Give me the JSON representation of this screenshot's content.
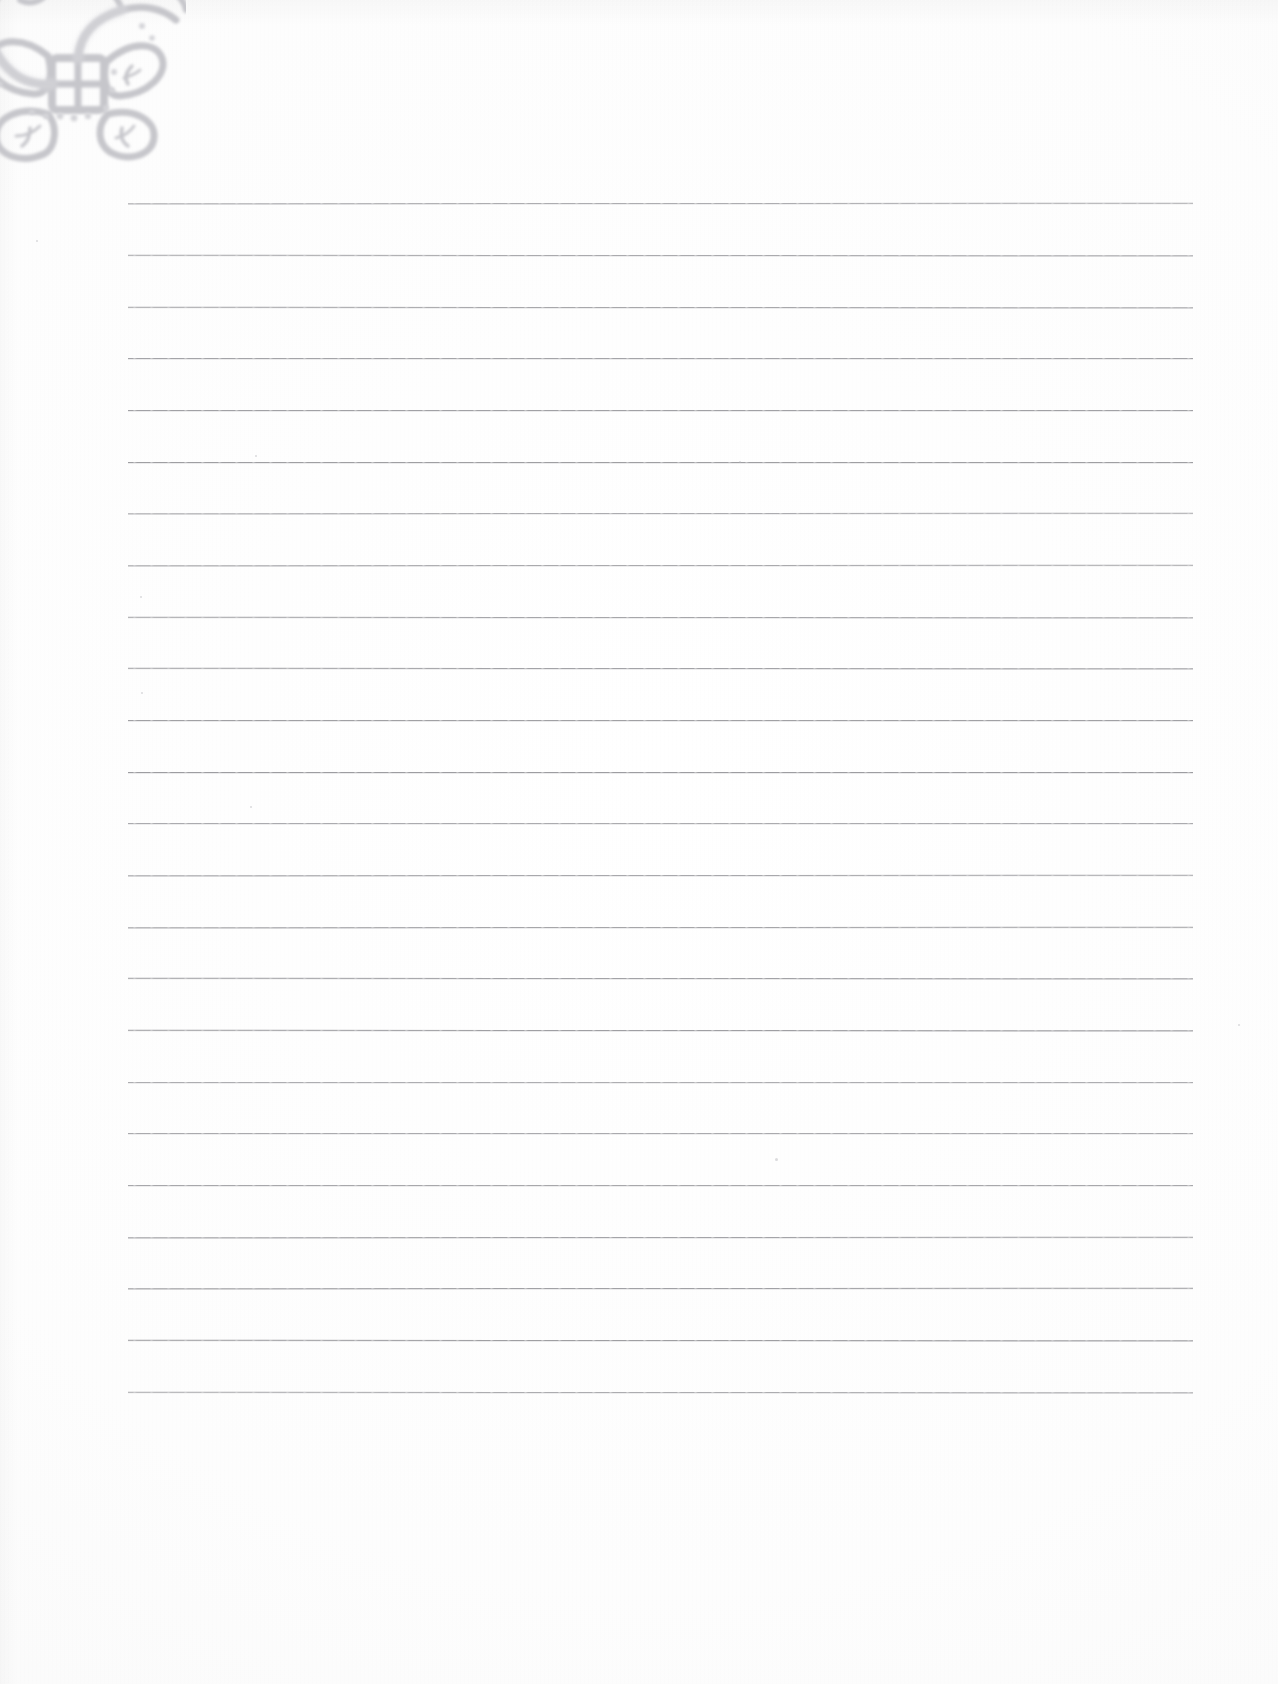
{
  "document": {
    "kind": "scanned-page",
    "title": "Blank ruled notepad page",
    "page_width": 1278,
    "page_height": 1684,
    "background_color": "#fdfdfd",
    "has_text": false,
    "text_content": ""
  },
  "ornament": {
    "name": "lace-corner-ornament",
    "description": "Faint grey lace / embossed floral corner motif with four leaf shapes around a square lattice center",
    "color": "#c9c9cd",
    "accent_color": "#bdbdc2",
    "position": "top-left",
    "bounds": {
      "x": -44,
      "y": -34,
      "width": 230,
      "height": 205
    }
  },
  "ruling": {
    "line_color": "#9a9a9e",
    "line_thickness": 1,
    "line_start_x": 128,
    "line_end_x": 1193,
    "first_line_y": 203,
    "line_spacing": 51.7,
    "line_count": 24,
    "line_y_positions": [
      203,
      255,
      307,
      358,
      410,
      462,
      513,
      565,
      617,
      668,
      720,
      772,
      823,
      875,
      927,
      978,
      1030,
      1082,
      1133,
      1185,
      1237,
      1288,
      1340,
      1392
    ]
  },
  "margins": {
    "left_margin": 128,
    "right_margin": 85,
    "top_margin": 203,
    "bottom_margin": 292
  },
  "specks": [
    {
      "x": 140,
      "y": 596,
      "size": 2
    },
    {
      "x": 141,
      "y": 692,
      "size": 2
    },
    {
      "x": 775,
      "y": 1158,
      "size": 3
    },
    {
      "x": 36,
      "y": 240,
      "size": 2
    },
    {
      "x": 255,
      "y": 455,
      "size": 2
    },
    {
      "x": 739,
      "y": 461,
      "size": 2
    },
    {
      "x": 1238,
      "y": 1024,
      "size": 2
    },
    {
      "x": 250,
      "y": 806,
      "size": 2
    }
  ]
}
